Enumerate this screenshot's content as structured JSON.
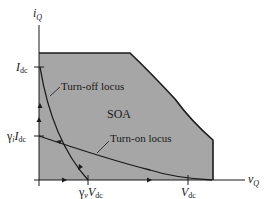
{
  "diagram": {
    "type": "safe-operating-area",
    "colors": {
      "soa_fill": "#a6a6a6",
      "line": "#1a1a1a",
      "background": "#ffffff"
    },
    "axes": {
      "y_label_main": "i",
      "y_label_sub": "Q",
      "x_label_main": "v",
      "x_label_sub": "Q"
    },
    "ticks": {
      "idc_main": "I",
      "idc_sub": "dc",
      "gamma_i": "γ",
      "gamma_i_sub": "i",
      "gamma_i_idc_main": "I",
      "gamma_i_idc_sub": "dc",
      "gamma_v": "γ",
      "gamma_v_sub": "v",
      "gamma_v_vdc_main": "V",
      "gamma_v_vdc_sub": "dc",
      "vdc_main": "V",
      "vdc_sub": "dc"
    },
    "labels": {
      "soa": "SOA",
      "turn_off": "Turn-off locus",
      "turn_on": "Turn-on locus"
    }
  }
}
